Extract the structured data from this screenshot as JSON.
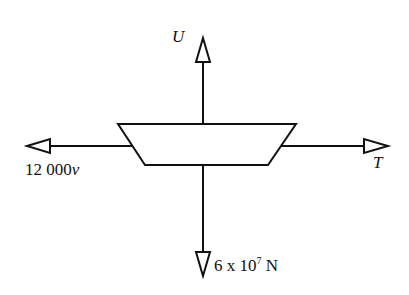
{
  "diagram": {
    "colors": {
      "stroke": "#111111",
      "background": "#ffffff"
    },
    "forces": {
      "up": {
        "label": "U",
        "direction": "up"
      },
      "left": {
        "label_main": "12 000",
        "label_var": "v",
        "direction": "left"
      },
      "right": {
        "label": "T",
        "direction": "right"
      },
      "down": {
        "label_coef": "6 x 10",
        "label_exp": "7",
        "label_unit": " N",
        "direction": "down"
      }
    },
    "body": {
      "shape": "trapezoid",
      "wide_side": "top"
    }
  }
}
